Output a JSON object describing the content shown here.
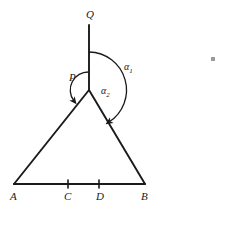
{
  "figure": {
    "type": "geometry-diagram",
    "stroke_color": "#1a1a1a",
    "background_color": "#ffffff"
  },
  "points": {
    "Q": {
      "label": "Q",
      "x": 89,
      "y": 25
    },
    "P": {
      "label": "P",
      "x": 89,
      "y": 90
    },
    "A": {
      "label": "A",
      "x": 14,
      "y": 184
    },
    "C": {
      "label": "C",
      "x": 68,
      "y": 184
    },
    "D": {
      "label": "D",
      "x": 99,
      "y": 184
    },
    "B": {
      "label": "B",
      "x": 145,
      "y": 184
    }
  },
  "segments": [
    {
      "name": "PQ",
      "from": "P",
      "to": "Q"
    },
    {
      "name": "AP",
      "from": "A",
      "to": "P"
    },
    {
      "name": "PB",
      "from": "P",
      "to": "B"
    },
    {
      "name": "AB",
      "from": "A",
      "to": "B"
    }
  ],
  "tick_marks": [
    {
      "name": "tick-C",
      "at": "C"
    },
    {
      "name": "tick-D",
      "at": "D"
    }
  ],
  "angles": [
    {
      "name": "alpha-1",
      "label": "α",
      "subscript": "1",
      "vertex": "P",
      "from_ray": "PQ",
      "to_ray": "PB",
      "radius": 38,
      "arrow": "to_ray"
    },
    {
      "name": "alpha-2",
      "label": "α",
      "subscript": "2",
      "vertex": "P",
      "from_ray": "PQ",
      "to_ray": "PA",
      "radius": 18,
      "arrow": "to_ray"
    }
  ],
  "artifacts": [
    {
      "name": "scan-speck",
      "x": 211,
      "y": 57
    }
  ]
}
